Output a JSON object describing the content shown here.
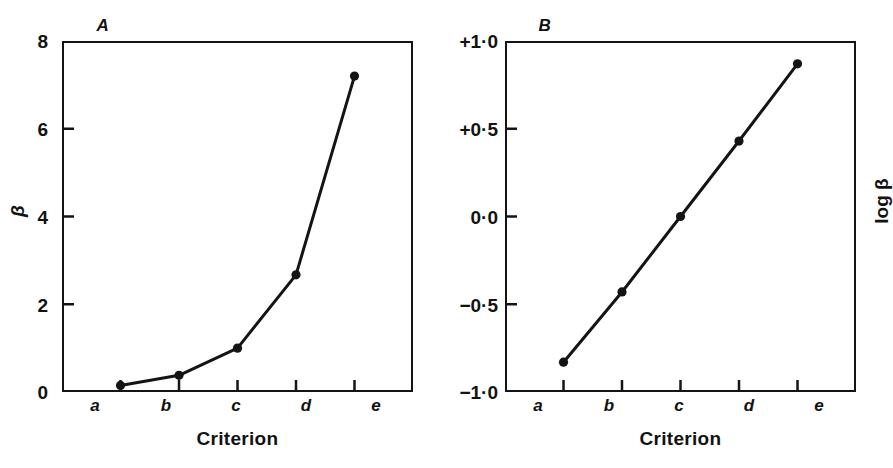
{
  "figure": {
    "background": "#ffffff",
    "ink_color": "#141414"
  },
  "panels": [
    {
      "id": "A",
      "title": "A",
      "xlabel": "Criterion",
      "ylabel": "β",
      "ytick_labels": [
        "8",
        "6",
        "4",
        "2",
        "0"
      ],
      "xtick_labels": [
        "a",
        "b",
        "c",
        "d",
        "e"
      ]
    },
    {
      "id": "B",
      "title": "B",
      "xlabel": "Criterion",
      "ylabel": "log β",
      "ytick_labels": [
        "+1·0",
        "+0·5",
        "0·0",
        "−0·5",
        "−1·0"
      ],
      "xtick_labels": [
        "a",
        "b",
        "c",
        "d",
        "e"
      ]
    }
  ],
  "chart_data": [
    {
      "type": "line",
      "panel": "A",
      "title": "A",
      "xlabel": "Criterion",
      "ylabel": "β",
      "categories": [
        "a",
        "b",
        "c",
        "d",
        "e"
      ],
      "values": [
        0.15,
        0.38,
        1.0,
        2.67,
        7.2
      ],
      "yticks": [
        0,
        2,
        4,
        6,
        8
      ],
      "ytick_labels": [
        "0",
        "2",
        "4",
        "6",
        "8"
      ],
      "ylim": [
        0,
        8
      ],
      "grid": false,
      "legend": null,
      "markers": "filled-circle",
      "line_color": "#141414"
    },
    {
      "type": "line",
      "panel": "B",
      "title": "B",
      "xlabel": "Criterion",
      "ylabel": "log β",
      "categories": [
        "a",
        "b",
        "c",
        "d",
        "e"
      ],
      "values": [
        -0.83,
        -0.43,
        0.0,
        0.43,
        0.87
      ],
      "yticks": [
        -1.0,
        -0.5,
        0.0,
        0.5,
        1.0
      ],
      "ytick_labels": [
        "−1·0",
        "−0·5",
        "0·0",
        "+0·5",
        "+1·0"
      ],
      "ylim": [
        -1.0,
        1.0
      ],
      "grid": false,
      "legend": null,
      "markers": "filled-circle",
      "line_color": "#141414"
    }
  ]
}
